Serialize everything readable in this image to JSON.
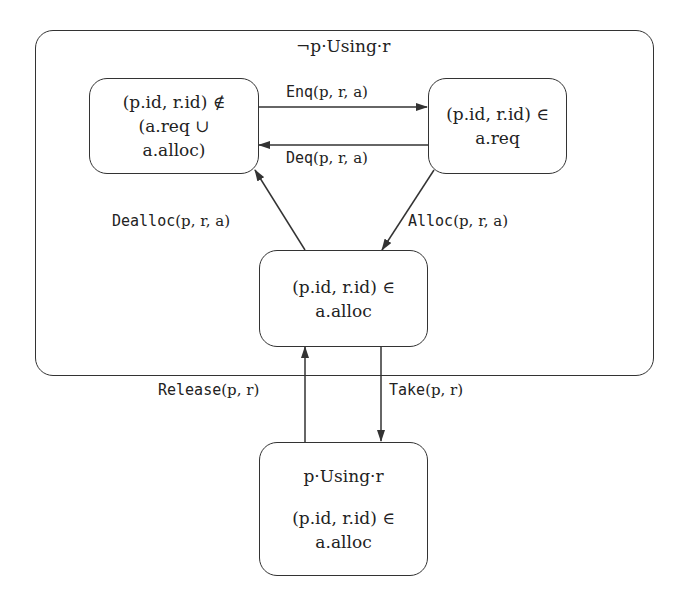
{
  "diagram": {
    "type": "state-machine",
    "frame": {
      "title": "¬p·Using·r"
    },
    "states": {
      "not_requested": {
        "lines": [
          "(p.id, r.id) ∉",
          "(a.req ∪",
          "a.alloc)"
        ]
      },
      "requested": {
        "lines": [
          "(p.id, r.id) ∈",
          "a.req"
        ]
      },
      "allocated": {
        "lines": [
          "(p.id, r.id) ∈",
          "a.alloc"
        ]
      },
      "using": {
        "title": "p·Using·r",
        "lines": [
          "(p.id, r.id) ∈",
          "a.alloc"
        ]
      }
    },
    "transitions": {
      "enq": {
        "name": "Enq",
        "args": "(p, r, a)",
        "from": "not_requested",
        "to": "requested"
      },
      "deq": {
        "name": "Deq",
        "args": "(p, r, a)",
        "from": "requested",
        "to": "not_requested"
      },
      "alloc": {
        "name": "Alloc",
        "args": "(p, r, a)",
        "from": "requested",
        "to": "allocated"
      },
      "dealloc": {
        "name": "Dealloc",
        "args": "(p, r, a)",
        "from": "allocated",
        "to": "not_requested"
      },
      "take": {
        "name": "Take",
        "args": "(p, r)",
        "from": "allocated",
        "to": "using"
      },
      "release": {
        "name": "Release",
        "args": "(p, r)",
        "from": "using",
        "to": "allocated"
      }
    },
    "colors": {
      "stroke": "#333333",
      "text": "#222222",
      "background": "#ffffff"
    }
  }
}
